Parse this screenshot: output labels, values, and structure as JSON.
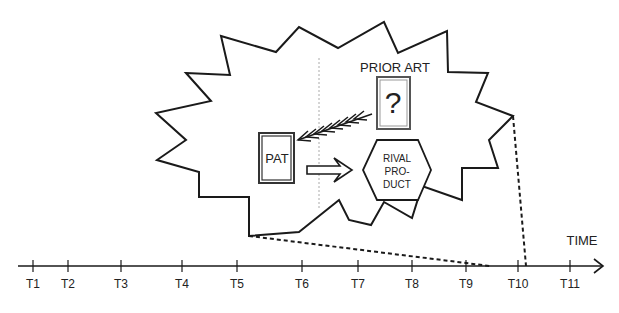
{
  "diagram": {
    "labels": {
      "prior_art": "PRIOR ART",
      "question_mark": "?",
      "pat": "PAT",
      "rival_line1": "RIVAL",
      "rival_line2": "PRO-",
      "rival_line3": "DUCT",
      "time": "TIME"
    },
    "timeline": {
      "ticks": [
        {
          "label": "T1",
          "x": 33
        },
        {
          "label": "T2",
          "x": 68
        },
        {
          "label": "T3",
          "x": 121
        },
        {
          "label": "T4",
          "x": 182
        },
        {
          "label": "T5",
          "x": 237
        },
        {
          "label": "T6",
          "x": 302
        },
        {
          "label": "T7",
          "x": 358
        },
        {
          "label": "T8",
          "x": 412
        },
        {
          "label": "T9",
          "x": 466
        },
        {
          "label": "T10",
          "x": 518
        },
        {
          "label": "T11",
          "x": 570
        }
      ]
    },
    "colors": {
      "stroke": "#1a1a1a",
      "frame": "#444444",
      "dotted_guide": "#aaaaaa"
    }
  }
}
